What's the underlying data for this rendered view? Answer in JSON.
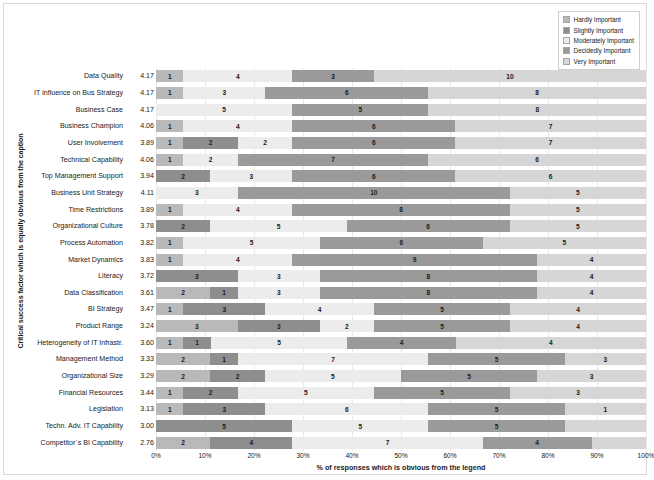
{
  "chart": {
    "type": "bar",
    "title": "",
    "xlabel": "% of responses which is obvious from the legend",
    "ylabel": "Critical success factor which is equally obvious from the caption"
  },
  "legend": {
    "position": "top-right",
    "items": [
      {
        "label": "Hardly Important",
        "color": "#b9b9b9"
      },
      {
        "label": "Slightly Important",
        "color": "#8e8e8e"
      },
      {
        "label": "Moderately Important",
        "color": "#ececec"
      },
      {
        "label": "Decidedly Important",
        "color": "#9a9a9a"
      },
      {
        "label": "Very Important",
        "color": "#d6d6d6"
      }
    ]
  },
  "xaxis": {
    "ticks": [
      "0%",
      "10%",
      "20%",
      "30%",
      "40%",
      "50%",
      "60%",
      "70%",
      "80%",
      "90%",
      "100%"
    ],
    "min": 0,
    "max": 100
  },
  "chart_data": {
    "type": "bar",
    "subtype": "stacked-100-percent-horizontal",
    "title": "",
    "xlabel": "% of responses which is obvious from the legend",
    "ylabel": "Critical success factor which is equally obvious from the caption",
    "xlim": [
      0,
      100
    ],
    "grid": true,
    "legend_position": "top-right",
    "total_responses_per_row": 18,
    "series": [
      {
        "name": "Hardly Important",
        "values": [
          1,
          1,
          0,
          1,
          1,
          1,
          2,
          0,
          1,
          0,
          1,
          1,
          0,
          0,
          1,
          0,
          1,
          0,
          0,
          1,
          1,
          0,
          0
        ]
      },
      {
        "name": "Slightly Important",
        "values": [
          0,
          0,
          0,
          0,
          2,
          2,
          0,
          0,
          0,
          2,
          0,
          0,
          3,
          2,
          3,
          3,
          1,
          2,
          2,
          2,
          3,
          5,
          2
        ]
      },
      {
        "name": "Moderately Important",
        "values": [
          4,
          3,
          5,
          4,
          2,
          2,
          3,
          3,
          4,
          5,
          5,
          4,
          3,
          3,
          4,
          2,
          5,
          7,
          5,
          5,
          6,
          5,
          4
        ]
      },
      {
        "name": "Decidedly Important",
        "values": [
          3,
          6,
          5,
          6,
          6,
          7,
          6,
          10,
          8,
          6,
          6,
          9,
          8,
          8,
          5,
          5,
          4,
          5,
          5,
          5,
          5,
          5,
          7
        ]
      },
      {
        "name": "Very Important",
        "values": [
          10,
          8,
          8,
          7,
          7,
          6,
          7,
          5,
          5,
          5,
          6,
          4,
          4,
          5,
          5,
          8,
          7,
          4,
          6,
          5,
          3,
          3,
          5
        ]
      }
    ],
    "categories": [
      {
        "label": "Data Quality",
        "mean": "4.17"
      },
      {
        "label": "IT influence on Bus Strategy",
        "mean": "4.17"
      },
      {
        "label": "Business Case",
        "mean": "4.17"
      },
      {
        "label": "Business Champion",
        "mean": "4.06"
      },
      {
        "label": "User Involvement",
        "mean": "3.89"
      },
      {
        "label": "Technical Capability",
        "mean": "4.06"
      },
      {
        "label": "Top Management Support",
        "mean": "3.94"
      },
      {
        "label": "Business Unit Strategy",
        "mean": "4.11"
      },
      {
        "label": "Time Restrictions",
        "mean": "3.89"
      },
      {
        "label": "Organizational Culture",
        "mean": "3.78"
      },
      {
        "label": "Process Automation",
        "mean": "3.82"
      },
      {
        "label": "Market Dynamics",
        "mean": "3.83"
      },
      {
        "label": "Literacy",
        "mean": "3.72"
      },
      {
        "label": "Data Classification",
        "mean": "3.61"
      },
      {
        "label": "BI Strategy",
        "mean": "3.47"
      },
      {
        "label": "Product Range",
        "mean": "3.24"
      },
      {
        "label": "Heterogeneity of IT Infrastr.",
        "mean": "3.60"
      },
      {
        "label": "Management Method",
        "mean": "3.33"
      },
      {
        "label": "Organizational Size",
        "mean": "3.29"
      },
      {
        "label": "Financial Resources",
        "mean": "3.44"
      },
      {
        "label": "Legislation",
        "mean": "3.13"
      },
      {
        "label": "Techn. Adv. IT Capability",
        "mean": "3.00"
      },
      {
        "label": "Competitor`s BI Capability",
        "mean": "2.76"
      }
    ],
    "rows": [
      {
        "label": "Data Quality",
        "mean": "4.17",
        "segments": [
          1,
          0,
          4,
          3,
          10
        ]
      },
      {
        "label": "IT influence on Bus Strategy",
        "mean": "4.17",
        "segments": [
          1,
          0,
          3,
          6,
          8
        ]
      },
      {
        "label": "Business Case",
        "mean": "4.17",
        "segments": [
          0,
          0,
          5,
          5,
          8
        ]
      },
      {
        "label": "Business Champion",
        "mean": "4.06",
        "segments": [
          1,
          0,
          4,
          6,
          7
        ]
      },
      {
        "label": "User Involvement",
        "mean": "3.89",
        "segments": [
          1,
          2,
          2,
          6,
          7
        ]
      },
      {
        "label": "Technical Capability",
        "mean": "4.06",
        "segments": [
          1,
          2,
          2,
          7,
          6
        ]
      },
      {
        "label": "Top Management Support",
        "mean": "3.94",
        "segments": [
          2,
          0,
          3,
          6,
          7
        ]
      },
      {
        "label": "Business Unit Strategy",
        "mean": "4.11",
        "segments": [
          0,
          0,
          3,
          10,
          5
        ]
      },
      {
        "label": "Time Restrictions",
        "mean": "3.89",
        "segments": [
          1,
          0,
          4,
          8,
          5
        ]
      },
      {
        "label": "Organizational Culture",
        "mean": "3.78",
        "segments": [
          0,
          2,
          5,
          6,
          5
        ]
      },
      {
        "label": "Process Automation",
        "mean": "3.82",
        "segments": [
          1,
          0,
          5,
          6,
          5
        ]
      },
      {
        "label": "Market Dynamics",
        "mean": "3.83",
        "segments": [
          1,
          0,
          4,
          9,
          4
        ]
      },
      {
        "label": "Literacy",
        "mean": "3.72",
        "segments": [
          0,
          3,
          3,
          8,
          4
        ]
      },
      {
        "label": "Data Classification",
        "mean": "3.61",
        "segments": [
          0,
          2,
          1,
          3,
          8,
          4
        ]
      },
      {
        "label": "BI Strategy",
        "mean": "3.47",
        "segments": [
          1,
          3,
          4,
          5,
          4
        ]
      },
      {
        "label": "Product Range",
        "mean": "3.24",
        "segments": [
          0,
          3,
          3,
          2,
          5,
          4
        ]
      },
      {
        "label": "Heterogeneity of IT Infrastr.",
        "mean": "3.60",
        "segments": [
          1,
          1,
          5,
          4,
          4
        ]
      },
      {
        "label": "Management Method",
        "mean": "3.33",
        "segments": [
          0,
          2,
          1,
          7,
          5,
          3
        ]
      },
      {
        "label": "Organizational Size",
        "mean": "3.29",
        "segments": [
          0,
          2,
          2,
          5,
          5,
          3
        ]
      },
      {
        "label": "Financial Resources",
        "mean": "3.44",
        "segments": [
          1,
          2,
          5,
          5,
          3
        ]
      },
      {
        "label": "Legislation",
        "mean": "3.13",
        "segments": [
          1,
          3,
          6,
          5,
          1
        ]
      },
      {
        "label": "Techn. Adv. IT Capability",
        "mean": "3.00",
        "segments": [
          0,
          5,
          5,
          5,
          3
        ]
      },
      {
        "label": "Competitor`s BI Capability",
        "mean": "2.76",
        "segments": [
          0,
          2,
          4,
          7,
          4
        ]
      }
    ],
    "row_layouts": [
      [
        {
          "c": 0,
          "w": 5.6,
          "v": "1"
        },
        {
          "c": 2,
          "w": 22.2,
          "v": "4"
        },
        {
          "c": 3,
          "w": 16.7,
          "v": "3"
        },
        {
          "c": 4,
          "w": 55.5,
          "v": "10"
        }
      ],
      [
        {
          "c": 0,
          "w": 5.6,
          "v": "1"
        },
        {
          "c": 2,
          "w": 16.7,
          "v": "3"
        },
        {
          "c": 3,
          "w": 33.3,
          "v": "6"
        },
        {
          "c": 4,
          "w": 44.4,
          "v": "8"
        }
      ],
      [
        {
          "c": 2,
          "w": 27.8,
          "v": "5"
        },
        {
          "c": 3,
          "w": 27.8,
          "v": "5"
        },
        {
          "c": 4,
          "w": 44.4,
          "v": "8"
        }
      ],
      [
        {
          "c": 0,
          "w": 5.6,
          "v": "1"
        },
        {
          "c": 2,
          "w": 22.2,
          "v": "4"
        },
        {
          "c": 3,
          "w": 33.3,
          "v": "6"
        },
        {
          "c": 4,
          "w": 38.9,
          "v": "7"
        }
      ],
      [
        {
          "c": 0,
          "w": 5.6,
          "v": "1"
        },
        {
          "c": 1,
          "w": 11.1,
          "v": "2"
        },
        {
          "c": 2,
          "w": 11.1,
          "v": "2"
        },
        {
          "c": 3,
          "w": 33.3,
          "v": "6"
        },
        {
          "c": 4,
          "w": 38.9,
          "v": "7"
        }
      ],
      [
        {
          "c": 0,
          "w": 5.6,
          "v": "1"
        },
        {
          "c": 2,
          "w": 11.1,
          "v": "2"
        },
        {
          "c": 3,
          "w": 38.9,
          "v": "7"
        },
        {
          "c": 4,
          "w": 44.4,
          "v": "6"
        }
      ],
      [
        {
          "c": 1,
          "w": 11.1,
          "v": "2"
        },
        {
          "c": 2,
          "w": 16.7,
          "v": "3"
        },
        {
          "c": 3,
          "w": 33.3,
          "v": "6"
        },
        {
          "c": 4,
          "w": 38.9,
          "v": "6"
        }
      ],
      [
        {
          "c": 2,
          "w": 16.7,
          "v": "3"
        },
        {
          "c": 3,
          "w": 55.5,
          "v": "10"
        },
        {
          "c": 4,
          "w": 27.8,
          "v": "5"
        }
      ],
      [
        {
          "c": 0,
          "w": 5.6,
          "v": "1"
        },
        {
          "c": 2,
          "w": 22.2,
          "v": "4"
        },
        {
          "c": 3,
          "w": 44.4,
          "v": "8"
        },
        {
          "c": 4,
          "w": 27.8,
          "v": "5"
        }
      ],
      [
        {
          "c": 1,
          "w": 11.1,
          "v": "2"
        },
        {
          "c": 2,
          "w": 27.8,
          "v": "5"
        },
        {
          "c": 3,
          "w": 33.3,
          "v": "6"
        },
        {
          "c": 4,
          "w": 27.8,
          "v": "5"
        }
      ],
      [
        {
          "c": 0,
          "w": 5.6,
          "v": "1"
        },
        {
          "c": 2,
          "w": 27.8,
          "v": "5"
        },
        {
          "c": 3,
          "w": 33.3,
          "v": "6"
        },
        {
          "c": 4,
          "w": 33.3,
          "v": "5"
        }
      ],
      [
        {
          "c": 0,
          "w": 5.6,
          "v": "1"
        },
        {
          "c": 2,
          "w": 22.2,
          "v": "4"
        },
        {
          "c": 3,
          "w": 50.0,
          "v": "9"
        },
        {
          "c": 4,
          "w": 22.2,
          "v": "4"
        }
      ],
      [
        {
          "c": 1,
          "w": 16.7,
          "v": "3"
        },
        {
          "c": 2,
          "w": 16.7,
          "v": "3"
        },
        {
          "c": 3,
          "w": 44.4,
          "v": "8"
        },
        {
          "c": 4,
          "w": 22.2,
          "v": "4"
        }
      ],
      [
        {
          "c": 0,
          "w": 11.1,
          "v": "2"
        },
        {
          "c": 1,
          "w": 5.6,
          "v": "1"
        },
        {
          "c": 2,
          "w": 16.7,
          "v": "3"
        },
        {
          "c": 3,
          "w": 44.4,
          "v": "8"
        },
        {
          "c": 4,
          "w": 22.2,
          "v": "4"
        }
      ],
      [
        {
          "c": 0,
          "w": 5.6,
          "v": "1"
        },
        {
          "c": 1,
          "w": 16.7,
          "v": "3"
        },
        {
          "c": 2,
          "w": 22.2,
          "v": "4"
        },
        {
          "c": 3,
          "w": 27.8,
          "v": "5"
        },
        {
          "c": 4,
          "w": 27.7,
          "v": "4"
        }
      ],
      [
        {
          "c": 0,
          "w": 16.7,
          "v": "3"
        },
        {
          "c": 1,
          "w": 16.7,
          "v": "3"
        },
        {
          "c": 2,
          "w": 11.1,
          "v": "2"
        },
        {
          "c": 3,
          "w": 27.8,
          "v": "5"
        },
        {
          "c": 4,
          "w": 27.7,
          "v": "4"
        }
      ],
      [
        {
          "c": 0,
          "w": 5.6,
          "v": "1"
        },
        {
          "c": 1,
          "w": 5.6,
          "v": "1"
        },
        {
          "c": 2,
          "w": 27.8,
          "v": "5"
        },
        {
          "c": 3,
          "w": 22.2,
          "v": "4"
        },
        {
          "c": 4,
          "w": 38.8,
          "v": "4"
        }
      ],
      [
        {
          "c": 0,
          "w": 11.1,
          "v": "2"
        },
        {
          "c": 1,
          "w": 5.6,
          "v": "1"
        },
        {
          "c": 2,
          "w": 38.9,
          "v": "7"
        },
        {
          "c": 3,
          "w": 27.8,
          "v": "5"
        },
        {
          "c": 4,
          "w": 16.6,
          "v": "3"
        }
      ],
      [
        {
          "c": 0,
          "w": 11.1,
          "v": "2"
        },
        {
          "c": 1,
          "w": 11.1,
          "v": "2"
        },
        {
          "c": 2,
          "w": 27.8,
          "v": "5"
        },
        {
          "c": 3,
          "w": 27.8,
          "v": "5"
        },
        {
          "c": 4,
          "w": 22.2,
          "v": "3"
        }
      ],
      [
        {
          "c": 0,
          "w": 5.6,
          "v": "1"
        },
        {
          "c": 1,
          "w": 11.1,
          "v": "2"
        },
        {
          "c": 2,
          "w": 27.8,
          "v": "5"
        },
        {
          "c": 3,
          "w": 27.8,
          "v": "5"
        },
        {
          "c": 4,
          "w": 27.7,
          "v": "3"
        }
      ],
      [
        {
          "c": 0,
          "w": 5.6,
          "v": "1"
        },
        {
          "c": 1,
          "w": 16.7,
          "v": "3"
        },
        {
          "c": 2,
          "w": 33.3,
          "v": "6"
        },
        {
          "c": 3,
          "w": 27.8,
          "v": "5"
        },
        {
          "c": 4,
          "w": 16.6,
          "v": "1"
        }
      ],
      [
        {
          "c": 1,
          "w": 27.8,
          "v": "5"
        },
        {
          "c": 2,
          "w": 27.8,
          "v": "5"
        },
        {
          "c": 3,
          "w": 27.8,
          "v": "5"
        },
        {
          "c": 4,
          "w": 16.6,
          "v": ""
        }
      ],
      [
        {
          "c": 0,
          "w": 11.1,
          "v": "2"
        },
        {
          "c": 1,
          "w": 16.7,
          "v": "4"
        },
        {
          "c": 2,
          "w": 38.9,
          "v": "7"
        },
        {
          "c": 3,
          "w": 22.2,
          "v": "4"
        },
        {
          "c": 4,
          "w": 11.1,
          "v": ""
        }
      ]
    ]
  }
}
